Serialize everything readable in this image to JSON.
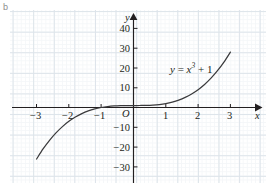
{
  "figure": {
    "part_label": "b",
    "equation_label": "y = x³ + 1",
    "origin_label": "O",
    "x_axis_name": "x",
    "y_axis_name": "y"
  },
  "chart_data": {
    "type": "line",
    "title": "",
    "subtitle": "",
    "xlabel": "x",
    "ylabel": "y",
    "function": "y = x^3 + 1",
    "equation_annotation": "y = x³ + 1",
    "grid": true,
    "grid_style": "graph-paper, minor 0.2 unit, major 1 unit",
    "legend": "none",
    "axis_style": "centered-cross with arrowheads",
    "origin_marker": "O",
    "xlim": [
      -3.6,
      3.5
    ],
    "ylim": [
      -36,
      47
    ],
    "xticks": [
      -3,
      -2,
      -1,
      1,
      2,
      3
    ],
    "xticklabels": [
      "−3",
      "−2",
      "−1",
      "1",
      "2",
      "3"
    ],
    "yticks": [
      40,
      30,
      20,
      10,
      -10,
      -20,
      -30
    ],
    "yticklabels": [
      "40",
      "30",
      "20",
      "10",
      "−10",
      "−20",
      "−30"
    ],
    "series": [
      {
        "name": "y = x^3 + 1",
        "color": "#3a3a3c",
        "x": [
          -3.0,
          -2.8,
          -2.6,
          -2.4,
          -2.2,
          -2.0,
          -1.8,
          -1.6,
          -1.4,
          -1.2,
          -1.0,
          -0.8,
          -0.6,
          -0.4,
          -0.2,
          0.0,
          0.2,
          0.4,
          0.6,
          0.8,
          1.0,
          1.2,
          1.4,
          1.6,
          1.8,
          2.0,
          2.2,
          2.4,
          2.6,
          2.8,
          3.0
        ],
        "y": [
          -26.0,
          -20.95,
          -16.58,
          -12.82,
          -9.65,
          -7.0,
          -4.83,
          -3.1,
          -1.74,
          -0.73,
          0.0,
          0.49,
          0.78,
          0.94,
          0.99,
          1.0,
          1.01,
          1.06,
          1.22,
          1.51,
          2.0,
          2.73,
          3.74,
          5.1,
          6.83,
          9.0,
          11.65,
          14.82,
          18.58,
          22.95,
          28.0
        ]
      }
    ]
  }
}
